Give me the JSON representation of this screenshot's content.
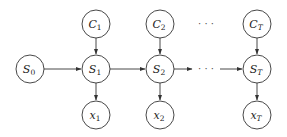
{
  "diagram": {
    "type": "graphical-model",
    "nodes": [
      {
        "id": "S0",
        "base": "S",
        "sub": "0",
        "x": 30,
        "y": 69
      },
      {
        "id": "C1",
        "base": "C",
        "sub": "1",
        "x": 96,
        "y": 24
      },
      {
        "id": "S1",
        "base": "S",
        "sub": "1",
        "x": 96,
        "y": 69
      },
      {
        "id": "x1",
        "base": "x",
        "sub": "1",
        "x": 96,
        "y": 115
      },
      {
        "id": "C2",
        "base": "C",
        "sub": "2",
        "x": 160,
        "y": 24
      },
      {
        "id": "S2",
        "base": "S",
        "sub": "2",
        "x": 160,
        "y": 69
      },
      {
        "id": "x2",
        "base": "x",
        "sub": "2",
        "x": 160,
        "y": 115
      },
      {
        "id": "CT",
        "base": "C",
        "sub": "T",
        "x": 257,
        "y": 24
      },
      {
        "id": "ST",
        "base": "S",
        "sub": "T",
        "x": 257,
        "y": 69
      },
      {
        "id": "xT",
        "base": "x",
        "sub": "T",
        "x": 257,
        "y": 115
      }
    ],
    "edges": [
      [
        "S0",
        "S1"
      ],
      [
        "S1",
        "S2"
      ],
      [
        "S2",
        "…"
      ],
      [
        "…",
        "ST"
      ],
      [
        "C1",
        "S1"
      ],
      [
        "C2",
        "S2"
      ],
      [
        "CT",
        "ST"
      ],
      [
        "S1",
        "x1"
      ],
      [
        "S2",
        "x2"
      ],
      [
        "ST",
        "xT"
      ]
    ],
    "ellipsis": "· · ·"
  }
}
